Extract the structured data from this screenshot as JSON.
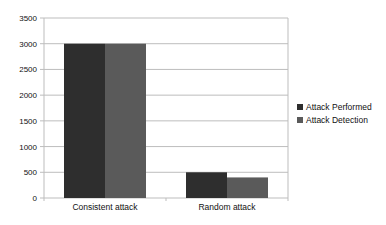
{
  "chart_data": {
    "type": "bar",
    "title": "",
    "xlabel": "",
    "ylabel": "",
    "categories": [
      "Consistent attack",
      "Random attack"
    ],
    "series": [
      {
        "name": "Attack Performed",
        "values": [
          3000,
          500
        ],
        "color": "#2e2e2e"
      },
      {
        "name": "Attack Detection",
        "values": [
          3000,
          400
        ],
        "color": "#5a5a5a"
      }
    ],
    "ylim": [
      0,
      3500
    ],
    "yticks": [
      0,
      500,
      1000,
      1500,
      2000,
      2500,
      3000,
      3500
    ],
    "grid": true,
    "legend_position": "right"
  }
}
